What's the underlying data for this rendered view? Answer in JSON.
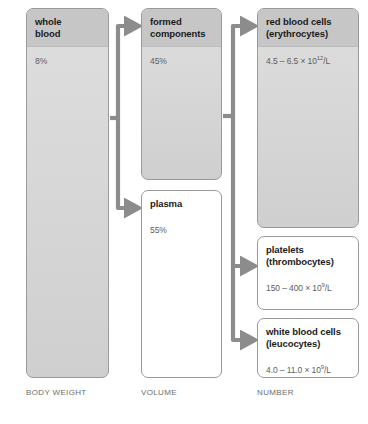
{
  "diagram": {
    "colors": {
      "box_fill": "#d6d6d6",
      "box_header": "#c6c6c6",
      "box_border": "#9a9a9a",
      "arrow": "#8c8c8c",
      "heading_text": "#1b1b1b",
      "value_text": "#5e5e5e",
      "caption_text": "#6d6d6d",
      "background": "#ffffff"
    },
    "columns": [
      {
        "id": "body-weight",
        "caption": "BODY WEIGHT"
      },
      {
        "id": "volume",
        "caption": "VOLUME"
      },
      {
        "id": "number",
        "caption": "NUMBER"
      }
    ],
    "nodes": {
      "whole_blood": {
        "title": "whole\nblood",
        "title_line1": "whole",
        "title_line2": "blood",
        "value": "8%",
        "filled": true
      },
      "formed_components": {
        "title_line1": "formed",
        "title_line2": "components",
        "value": "45%",
        "filled": true
      },
      "plasma": {
        "title_line1": "plasma",
        "title_line2": "",
        "value": "55%",
        "filled": false
      },
      "red_blood_cells": {
        "title_line1": "red blood cells",
        "title_line2": "(erythrocytes)",
        "value_mantissa": "4.5 – 6.5 × 10",
        "value_exponent": "12",
        "value_unit": "/L",
        "filled": true
      },
      "platelets": {
        "title_line1": "platelets",
        "title_line2": "(thrombocytes)",
        "value_mantissa": "150 – 400 × 10",
        "value_exponent": "9",
        "value_unit": "/L",
        "filled": false
      },
      "white_blood_cells": {
        "title_line1": "white blood cells",
        "title_line2": "(leucocytes)",
        "value_mantissa": "4.0 – 11.0 × 10",
        "value_exponent": "9",
        "value_unit": "/L",
        "filled": false
      }
    },
    "connectors": [
      {
        "id": "whole-blood-split",
        "from": "whole_blood",
        "to": [
          "formed_components",
          "plasma"
        ]
      },
      {
        "id": "formed-split",
        "from": "formed_components",
        "to": [
          "red_blood_cells",
          "platelets",
          "white_blood_cells"
        ]
      }
    ]
  }
}
